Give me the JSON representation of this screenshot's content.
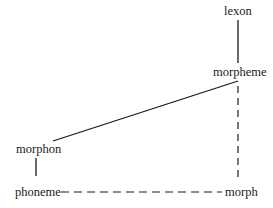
{
  "diagram": {
    "nodes": {
      "lexon": {
        "label": "lexon"
      },
      "morpheme": {
        "label": "morpheme"
      },
      "morphon": {
        "label": "morphon"
      },
      "phoneme": {
        "label": "phoneme"
      },
      "morph": {
        "label": "morph"
      }
    },
    "edges": [
      {
        "from": "lexon",
        "to": "morpheme",
        "style": "solid"
      },
      {
        "from": "morpheme",
        "to": "morphon",
        "style": "solid"
      },
      {
        "from": "morphon",
        "to": "phoneme",
        "style": "solid"
      },
      {
        "from": "morpheme",
        "to": "morph",
        "style": "dashed"
      },
      {
        "from": "phoneme",
        "to": "morph",
        "style": "dashed"
      }
    ],
    "colors": {
      "line": "#1a1a1a",
      "text": "#1a1a1a",
      "background": "#ffffff"
    }
  }
}
